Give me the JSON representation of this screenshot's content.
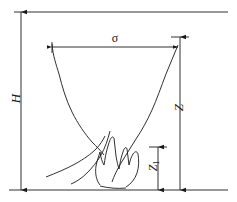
{
  "figure": {
    "background_color": "#ffffff",
    "line_color": "#1a1a1a",
    "width": 237,
    "height": 202,
    "labels": {
      "ceiling_height": "H",
      "plume_width": "σ",
      "plume_height": "Z",
      "flame_height_main": "Z",
      "flame_height_sub": "1"
    },
    "geometry": {
      "ceiling_line_y": 12,
      "floor_line_y": 190,
      "ceiling_line_x1": 14,
      "ceiling_line_x2": 228,
      "floor_line_x1": 9,
      "floor_line_x2": 228,
      "H_dimension_x": 21,
      "H_dimension_y_top": 12,
      "H_dimension_y_bottom": 190,
      "Z_dimension_x": 180,
      "Z_dimension_y_top": 37,
      "Z_dimension_y_bottom": 190,
      "Z1_dimension_x": 158,
      "Z1_dimension_y_top": 147,
      "Z1_dimension_y_bottom": 190,
      "sigma_dimension_y": 47,
      "sigma_dimension_x_left": 52,
      "sigma_dimension_x_right": 178
    }
  }
}
